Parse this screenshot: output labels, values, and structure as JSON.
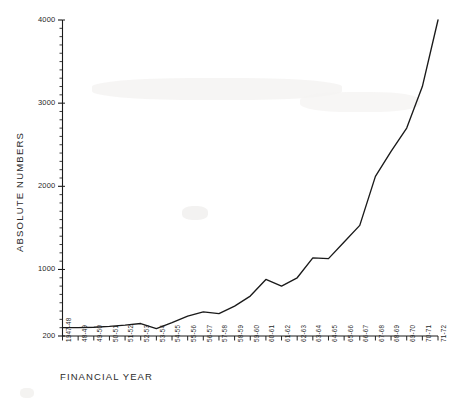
{
  "chart_data": {
    "type": "line",
    "title": "",
    "xlabel": "FINANCIAL YEAR",
    "ylabel": "ABSOLUTE NUMBERS",
    "categories": [
      "1947-48",
      "48-49",
      "49-50",
      "50-51",
      "51-52",
      "52-53",
      "53-54",
      "54-55",
      "55-56",
      "56-57",
      "57-58",
      "58-59",
      "59-60",
      "60-61",
      "61-62",
      "62-63",
      "63-64",
      "64-65",
      "65-66",
      "66-67",
      "67-68",
      "68-69",
      "69-70",
      "70-71",
      "71-72"
    ],
    "values": [
      300,
      300,
      305,
      315,
      330,
      350,
      290,
      360,
      440,
      490,
      470,
      560,
      680,
      880,
      800,
      900,
      1140,
      1130,
      1330,
      1530,
      2120,
      2420,
      2700,
      3200,
      4000
    ],
    "ylim": [
      200,
      4000
    ],
    "yticks": [
      200,
      1000,
      2000,
      3000,
      4000
    ],
    "yticks_minor_count": 38,
    "grid": false,
    "legend": null,
    "series_color": "#1a1a1a",
    "axis_color": "#1a1a1a"
  },
  "axes": {
    "y_tick_labels": [
      "4000",
      "3000",
      "2000",
      "1000",
      "200"
    ],
    "x_axis_title": "FINANCIAL YEAR",
    "y_axis_title": "ABSOLUTE NUMBERS"
  },
  "style": {
    "background": "#ffffff",
    "line_color": "#1a1a1a",
    "text_color": "#1f1f1f"
  }
}
